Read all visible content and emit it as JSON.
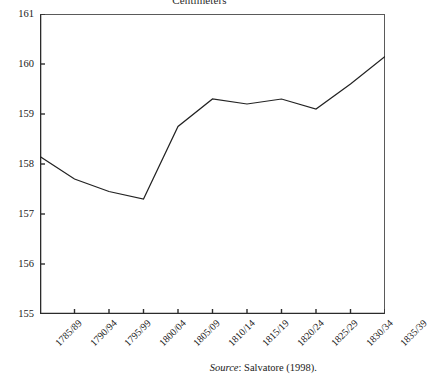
{
  "chart_data": {
    "type": "line",
    "title": "Centimeters",
    "xlabel": "",
    "ylabel": "",
    "ylim": [
      155,
      161
    ],
    "yticks": [
      155,
      156,
      157,
      158,
      159,
      160,
      161
    ],
    "ytick_labels": [
      "155",
      "156",
      "157",
      "158",
      "159",
      "160",
      "161"
    ],
    "grid": false,
    "legend": "none",
    "line_color": "#222222",
    "categories": [
      "1785/89",
      "1790/94",
      "1795/99",
      "1800/04",
      "1805/09",
      "1810/14",
      "1815/19",
      "1820/24",
      "1825/29",
      "1830/34",
      "1835/39"
    ],
    "values": [
      158.15,
      157.7,
      157.45,
      157.3,
      158.75,
      159.3,
      159.2,
      159.3,
      159.1,
      159.6,
      160.15
    ],
    "series": [
      {
        "name": "Height",
        "values": [
          158.15,
          157.7,
          157.45,
          157.3,
          158.75,
          159.3,
          159.2,
          159.3,
          159.1,
          159.6,
          160.15
        ]
      }
    ]
  },
  "source_note": {
    "label": "Source",
    "separator": ":",
    "text": "Salvatore (1998)."
  }
}
